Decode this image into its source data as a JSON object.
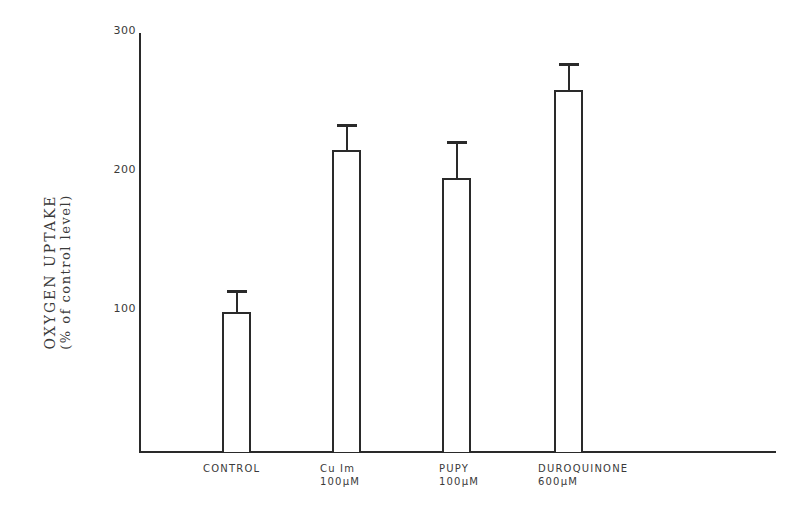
{
  "chart_data": {
    "type": "bar",
    "title": "",
    "xlabel": "",
    "ylabel": "OXYGEN UPTAKE",
    "ylabel_sub": "(% of control level)",
    "categories": [
      "CONTROL",
      "Cu Im 100µM",
      "PUPY 100µM",
      "DUROQUINONE 600µM"
    ],
    "category_lines": [
      [
        "CONTROL",
        ""
      ],
      [
        "Cu Im",
        "100µM"
      ],
      [
        "PUPY",
        "100µM"
      ],
      [
        "DUROQUINONE",
        "600µM"
      ]
    ],
    "values": [
      100,
      216,
      196,
      259
    ],
    "error_upper": [
      115,
      234,
      222,
      278
    ],
    "ylim": [
      0,
      300
    ],
    "yticks": [
      100,
      200,
      300
    ],
    "grid": false,
    "legend": null
  },
  "axis": {
    "tick_labels": [
      "100",
      "200",
      "300"
    ]
  }
}
